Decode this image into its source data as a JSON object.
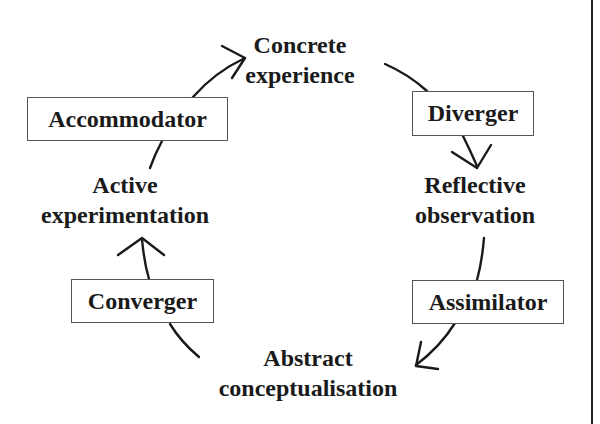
{
  "diagram": {
    "stages": {
      "concrete": {
        "line1": "Concrete",
        "line2": "experience"
      },
      "reflective": {
        "line1": "Reflective",
        "line2": "observation"
      },
      "abstract": {
        "line1": "Abstract",
        "line2": "conceptualisation"
      },
      "active": {
        "line1": "Active",
        "line2": "experimentation"
      }
    },
    "styles": {
      "accommodator": "Accommodator",
      "diverger": "Diverger",
      "assimilator": "Assimilator",
      "converger": "Converger"
    },
    "colors": {
      "ink": "#1a1a1a",
      "box_border": "#555555",
      "background": "#ffffff"
    }
  }
}
